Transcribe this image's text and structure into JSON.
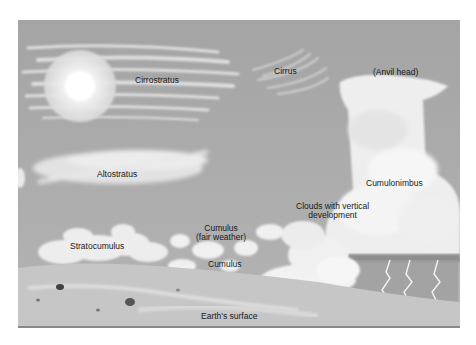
{
  "diagram": {
    "labels": {
      "cirrostratus": "Cirrostratus",
      "cirrus": "Cirrus",
      "anvil_head": "(Anvil head)",
      "altostratus": "Altostratus",
      "cumulonimbus": "Cumulonimbus",
      "vertical_line1": "Clouds with vertical",
      "vertical_line2": "development",
      "cumulus_fair_line1": "Cumulus",
      "cumulus_fair_line2": "(fair weather)",
      "stratocumulus": "Stratocumulus",
      "cumulus": "Cumulus",
      "earth_surface": "Earth's surface"
    },
    "colors": {
      "sky": "#a9a9a9",
      "cloud": "#f4f4f4",
      "ground": "#c8c8c8",
      "text": "#1a1a1a"
    }
  }
}
